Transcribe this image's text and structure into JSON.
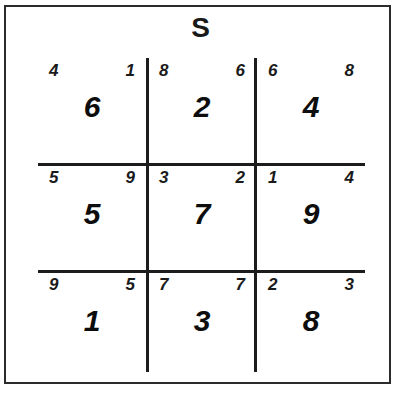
{
  "title": "S",
  "colors": {
    "ink": "#1a1a1a",
    "grid_line": "#1c1c1c",
    "border": "#2b2b2b",
    "background": "#ffffff"
  },
  "grid": {
    "rows": 3,
    "cols": 3,
    "cells": [
      {
        "position": "top-left",
        "corner_left": "4",
        "corner_right": "1",
        "value": "6"
      },
      {
        "position": "top-center",
        "corner_left": "8",
        "corner_right": "6",
        "value": "2"
      },
      {
        "position": "top-right",
        "corner_left": "6",
        "corner_right": "8",
        "value": "4"
      },
      {
        "position": "middle-left",
        "corner_left": "5",
        "corner_right": "9",
        "value": "5"
      },
      {
        "position": "middle-center",
        "corner_left": "3",
        "corner_right": "2",
        "value": "7"
      },
      {
        "position": "middle-right",
        "corner_left": "1",
        "corner_right": "4",
        "value": "9"
      },
      {
        "position": "bottom-left",
        "corner_left": "9",
        "corner_right": "5",
        "value": "1"
      },
      {
        "position": "bottom-center",
        "corner_left": "7",
        "corner_right": "7",
        "value": "3"
      },
      {
        "position": "bottom-right",
        "corner_left": "2",
        "corner_right": "3",
        "value": "8"
      }
    ]
  }
}
